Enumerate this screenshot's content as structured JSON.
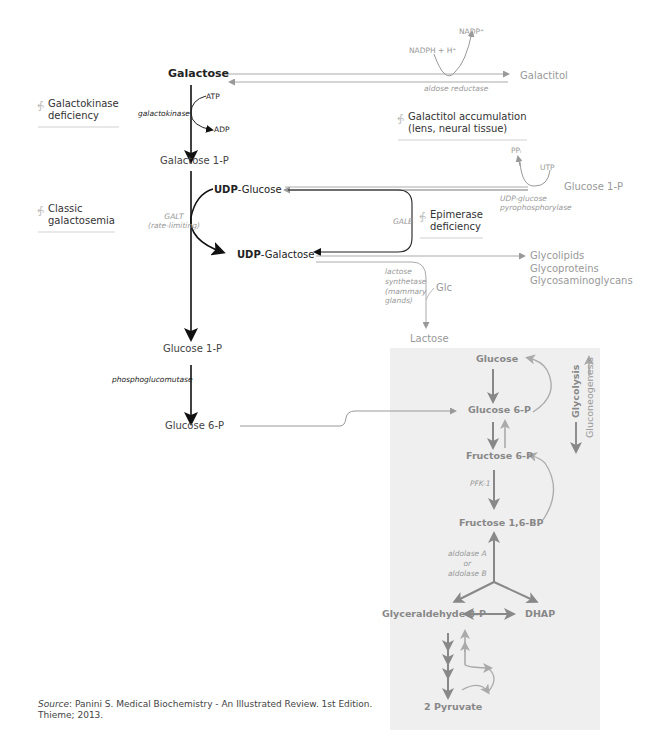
{
  "metabolites": {
    "galactose": "Galactose",
    "galactitol": "Galactitol",
    "galactose_1p": "Galactose 1-P",
    "udp_glucose_prefix": "UDP",
    "udp_glucose_suffix": "-Glucose",
    "udp_galactose_prefix": "UDP",
    "udp_galactose_suffix": "-Galactose",
    "glucose_1p_right": "Glucose 1-P",
    "glucose_1p": "Glucose 1-P",
    "glucose_6p": "Glucose 6-P",
    "glycolipids": "Glycolipids",
    "glycoproteins": "Glycoproteins",
    "glycosaminoglycans": "Glycosaminoglycans",
    "lactose": "Lactose",
    "glc": "Glc"
  },
  "cofactors": {
    "nadph": "NADPH + H⁺",
    "nadp": "NADP⁺",
    "atp": "ATP",
    "adp": "ADP",
    "ppi": "PPᵢ",
    "utp": "UTP"
  },
  "enzymes": {
    "aldose_reductase": "aldose reductase",
    "galactokinase": "galactokinase",
    "galt": "GALT",
    "galt_note": "(rate-limiting)",
    "gale": "GALE",
    "udp_glucose_pyrophosphorylase_1": "UDP-glucose",
    "udp_glucose_pyrophosphorylase_2": "pyrophosphorylase",
    "lactose_synthetase_1": "lactose",
    "lactose_synthetase_2": "synthetase",
    "lactose_synthetase_3": "(mammary",
    "lactose_synthetase_4": "glands)",
    "phosphoglucomutase": "phosphoglucomutase",
    "pfk1": "PFK-1",
    "aldolase_1": "aldolase A",
    "aldolase_2": "or",
    "aldolase_3": "aldolase B"
  },
  "disorders": {
    "galactokinase_1": "Galactokinase",
    "galactokinase_2": "deficiency",
    "classic_1": "Classic",
    "classic_2": "galactosemia",
    "galactitol_1": "Galactitol accumulation",
    "galactitol_2": "(lens, neural tissue)",
    "epimerase_1": "Epimerase",
    "epimerase_2": "deficiency"
  },
  "glycolysis_box": {
    "glucose": "Glucose",
    "glucose_6p": "Glucose 6-P",
    "fructose_6p": "Fructose 6-P",
    "fructose_16bp": "Fructose 1,6-BP",
    "glyceraldehyde_3p": "Glyceraldehyde 3-P",
    "dhap": "DHAP",
    "pyruvate": "2 Pyruvate",
    "glycolysis_label": "Glycolysis",
    "gluconeogenesis_label": "Gluconeogenesis"
  },
  "source": {
    "label": "Source",
    "line1": ": Panini S. Medical Biochemistry - An Illustrated Review. 1st Edition.",
    "line2": "Thieme; 2013."
  }
}
